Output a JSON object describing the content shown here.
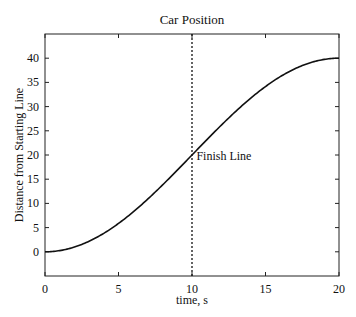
{
  "chart_data": {
    "type": "line",
    "title": "Car Position",
    "xlabel": "time, s",
    "ylabel": "Distance from Starting Line",
    "xlim": [
      0,
      20
    ],
    "ylim": [
      -5,
      45
    ],
    "xticks": [
      0,
      5,
      10,
      15,
      20
    ],
    "yticks": [
      0,
      5,
      10,
      15,
      20,
      25,
      30,
      35,
      40
    ],
    "grid": false,
    "legend": null,
    "series": [
      {
        "name": "position",
        "style": "solid",
        "x": [
          0,
          1,
          2,
          3,
          4,
          5,
          6,
          7,
          8,
          9,
          10,
          11,
          12,
          13,
          14,
          15,
          16,
          17,
          18,
          19,
          20
        ],
        "y": [
          0,
          0.25,
          0.98,
          2.18,
          3.82,
          5.86,
          8.24,
          10.92,
          13.82,
          16.87,
          20,
          23.13,
          26.18,
          29.08,
          31.76,
          34.14,
          36.18,
          37.82,
          39.02,
          39.75,
          40
        ]
      }
    ],
    "annotations": [
      {
        "type": "vline",
        "x": 10,
        "style": "dotted"
      },
      {
        "type": "text",
        "text": "Finish Line",
        "x": 10.3,
        "y": 19
      }
    ]
  }
}
